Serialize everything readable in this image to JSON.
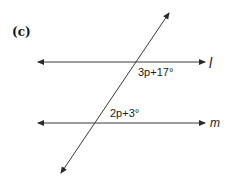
{
  "figure": {
    "part_label": "(c)",
    "lines": [
      {
        "id": "l",
        "label": "l",
        "type": "parallel",
        "x1": 37,
        "y1": 62,
        "x2": 205,
        "y2": 62
      },
      {
        "id": "m",
        "label": "m",
        "type": "parallel",
        "x1": 37,
        "y1": 123,
        "x2": 205,
        "y2": 123
      },
      {
        "id": "t",
        "label": "",
        "type": "transversal",
        "x1": 169,
        "y1": 13,
        "x2": 61,
        "y2": 173
      }
    ],
    "angles": [
      {
        "id": "angle-l",
        "expression": "3p+17°",
        "at_line": "l",
        "position": "below-right of intersection"
      },
      {
        "id": "angle-m",
        "expression": "2p+3°",
        "at_line": "m",
        "position": "above-right of intersection"
      }
    ],
    "colors": {
      "line": "#3a3a3a",
      "text": "#1a1a1a",
      "background": "#ffffff"
    }
  }
}
